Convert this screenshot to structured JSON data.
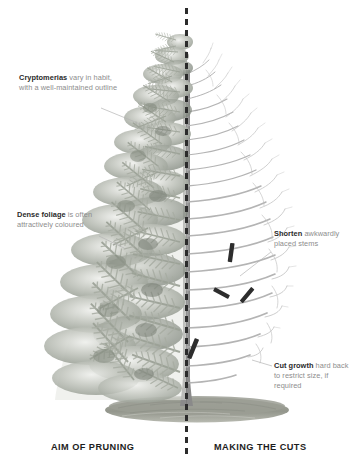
{
  "diagram": {
    "subject": "Cryptomeria",
    "divider": {
      "style": "dashed-vertical",
      "color": "#2b2b2b"
    }
  },
  "annotations": [
    {
      "id": "cryptomerias",
      "lead": "Cryptomerias",
      "body": " vary in habit, with a well-maintained outline",
      "side": "left",
      "points_to": "tree-crown"
    },
    {
      "id": "dense-foliage",
      "lead": "Dense foliage",
      "body": " is often attractively coloured",
      "side": "left",
      "points_to": "foliage-mass"
    },
    {
      "id": "shorten-stems",
      "lead": "Shorten",
      "body": " awkwardly placed stems",
      "side": "right",
      "points_to": "upper-cut-marks"
    },
    {
      "id": "cut-growth",
      "lead": "Cut growth",
      "body": " hard back to restrict size, if required",
      "side": "right",
      "points_to": "lower-cut-mark"
    }
  ],
  "captions": {
    "left": "AIM OF PRUNING",
    "right": "MAKING THE CUTS"
  },
  "cut_marks": [
    {
      "id": "cut-mark-1",
      "x": 232,
      "y": 252,
      "angle": 8,
      "length": 19
    },
    {
      "id": "cut-mark-2",
      "x": 222,
      "y": 293,
      "angle": -22,
      "length": 17
    },
    {
      "id": "cut-mark-3",
      "x": 248,
      "y": 295,
      "angle": 40,
      "length": 18
    },
    {
      "id": "cut-mark-4",
      "x": 194,
      "y": 348,
      "angle": 28,
      "length": 21
    }
  ],
  "colors": {
    "foliage_light": "#d8dad4",
    "foliage_mid": "#b7bbb3",
    "foliage_dark": "#8e938b",
    "branch": "#b2b2b2",
    "trunk": "#8c8c8c",
    "ground": "#9a9c93",
    "divider": "#2b2b2b",
    "text_lead": "#2a2a2a",
    "text_body": "#8d8d8d",
    "caption": "#1d1d1d",
    "leader_line": "#b0b0b0"
  }
}
